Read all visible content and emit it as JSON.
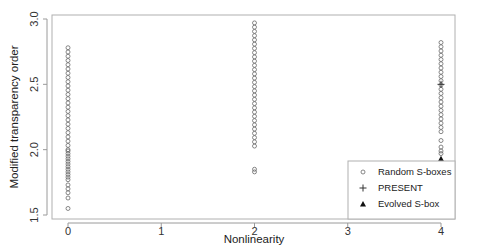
{
  "chart_data": {
    "type": "scatter",
    "title": "",
    "xlabel": "Nonlinearity",
    "ylabel": "Modified transparency order",
    "xlim": [
      -0.17,
      4.15
    ],
    "ylim": [
      1.47,
      3.03
    ],
    "xticks": [
      0,
      1,
      2,
      3,
      4
    ],
    "xtick_labels": [
      "0",
      "1",
      "2",
      "3",
      "4"
    ],
    "yticks": [
      1.5,
      2.0,
      2.5,
      3.0
    ],
    "ytick_labels": [
      "1.5",
      "2.0",
      "2.5",
      "3.0"
    ],
    "grid": false,
    "legend_position": "lower right",
    "series": [
      {
        "name": "Random S-boxes",
        "marker": "open-circle",
        "points": [
          {
            "x": 0,
            "y_range": [
              2.0,
              2.78
            ],
            "dense": true
          },
          {
            "x": 0,
            "y_values": [
              1.99,
              1.97,
              1.95,
              1.93,
              1.91,
              1.89,
              1.87,
              1.85,
              1.83,
              1.81,
              1.79,
              1.77,
              1.73,
              1.7,
              1.67,
              1.63,
              1.55
            ]
          },
          {
            "x": 2,
            "y_range": [
              2.0,
              2.97
            ],
            "dense": true
          },
          {
            "x": 2,
            "y_values": [
              1.85,
              1.83
            ]
          },
          {
            "x": 4,
            "y_range": [
              2.12,
              2.82
            ],
            "dense": true
          },
          {
            "x": 4,
            "y_values": [
              2.07,
              2.02,
              1.99,
              1.97
            ]
          }
        ]
      },
      {
        "name": "PRESENT",
        "marker": "plus",
        "points": [
          {
            "x": 4,
            "y": 2.5
          }
        ]
      },
      {
        "name": "Evolved S-box",
        "marker": "filled-triangle",
        "points": [
          {
            "x": 4,
            "y": 1.93
          }
        ]
      }
    ]
  },
  "legend": {
    "items": [
      {
        "symbol": "○",
        "label": "Random S-boxes"
      },
      {
        "symbol": "+",
        "label": "PRESENT"
      },
      {
        "symbol": "▲",
        "label": "Evolved S-box"
      }
    ]
  },
  "colors": {
    "marker": "#6a6a6a",
    "axis": "#9a9a9a",
    "text": "#222222",
    "filled": "#111111"
  }
}
